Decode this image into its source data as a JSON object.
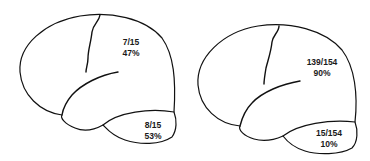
{
  "figure": {
    "panels": [
      {
        "id": "left-brain",
        "upper_region": {
          "fraction": "7/15",
          "percent": "47%"
        },
        "temporal_region": {
          "fraction": "8/15",
          "percent": "53%"
        }
      },
      {
        "id": "right-brain",
        "upper_region": {
          "fraction": "139/154",
          "percent": "90%"
        },
        "temporal_region": {
          "fraction": "15/154",
          "percent": "10%"
        }
      }
    ],
    "colors": {
      "stroke": "#111111",
      "background": "#ffffff"
    }
  }
}
